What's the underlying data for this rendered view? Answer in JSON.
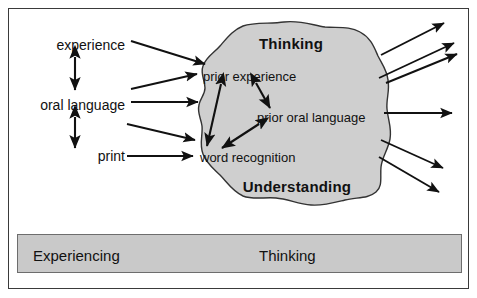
{
  "figure": {
    "colors": {
      "frame_border": "#3a3a3a",
      "blob_fill": "#cfcfcf",
      "blob_stroke": "#333333",
      "arrow": "#111111",
      "bar_fill": "#c9c9c9",
      "bar_border": "#6d6d6d",
      "text": "#111111",
      "background": "#ffffff"
    }
  },
  "inputs": {
    "items": [
      {
        "label": "experience",
        "x": 125,
        "y": 45
      },
      {
        "label": "oral language",
        "x": 125,
        "y": 105
      },
      {
        "label": "print",
        "x": 125,
        "y": 156
      }
    ]
  },
  "blob": {
    "top_title": "Thinking",
    "bottom_title": "Understanding",
    "terms": [
      {
        "label": "prior experience",
        "x": 203,
        "y": 76
      },
      {
        "label": "prior oral language",
        "x": 257,
        "y": 117
      },
      {
        "label": "word recognition",
        "x": 200,
        "y": 157
      }
    ]
  },
  "bottom_bar": {
    "left_label": "Experiencing",
    "right_label": "Thinking"
  },
  "arrows": {
    "vertical_double": [
      {
        "name": "experience-oral-language",
        "x": 75,
        "y1": 57,
        "y2": 90
      },
      {
        "name": "oral-language-print",
        "x": 75,
        "y1": 117,
        "y2": 148
      }
    ],
    "incoming": [
      {
        "name": "experience-to-prior-experience",
        "x1": 131,
        "y1": 41,
        "x2": 205,
        "y2": 64
      },
      {
        "name": "oral-language-to-prior-experience",
        "x1": 131,
        "y1": 89,
        "x2": 197,
        "y2": 74
      },
      {
        "name": "oral-language-to-blob",
        "x1": 131,
        "y1": 102,
        "x2": 198,
        "y2": 102
      },
      {
        "name": "print-to-blob",
        "x1": 127,
        "y1": 124,
        "x2": 195,
        "y2": 140
      },
      {
        "name": "print-to-word-recognition",
        "x1": 127,
        "y1": 156,
        "x2": 193,
        "y2": 156
      }
    ],
    "internal_double": [
      {
        "name": "prior-experience-word-recognition",
        "x1": 221,
        "y1": 84,
        "x2": 207,
        "y2": 146
      },
      {
        "name": "prior-experience-prior-oral-language",
        "x1": 256,
        "y1": 83,
        "x2": 270,
        "y2": 108
      },
      {
        "name": "prior-oral-language-word-recognition",
        "x1": 259,
        "y1": 124,
        "x2": 222,
        "y2": 148
      }
    ],
    "outgoing": [
      {
        "name": "outgoing-1",
        "x1": 381,
        "y1": 55,
        "x2": 444,
        "y2": 23
      },
      {
        "name": "outgoing-2",
        "x1": 379,
        "y1": 78,
        "x2": 454,
        "y2": 43
      },
      {
        "name": "outgoing-3",
        "x1": 386,
        "y1": 83,
        "x2": 457,
        "y2": 54
      },
      {
        "name": "outgoing-4",
        "x1": 384,
        "y1": 113,
        "x2": 452,
        "y2": 113
      },
      {
        "name": "outgoing-5",
        "x1": 381,
        "y1": 140,
        "x2": 443,
        "y2": 168
      },
      {
        "name": "outgoing-6",
        "x1": 379,
        "y1": 157,
        "x2": 439,
        "y2": 192
      }
    ]
  }
}
